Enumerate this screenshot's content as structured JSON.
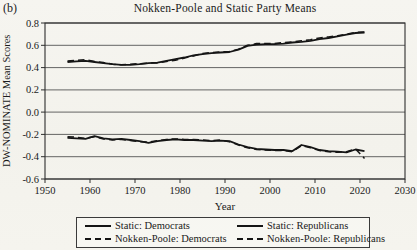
{
  "figure": {
    "panel_label": "(b)",
    "title": "Nokken-Poole and Static Party Means",
    "xlabel": "Year",
    "ylabel": "DW-NOMINATE Mean Scores"
  },
  "legend": {
    "items": [
      {
        "label": "Static: Democrats",
        "style": "solid"
      },
      {
        "label": "Static: Republicans",
        "style": "solid"
      },
      {
        "label": "Nokken-Poole: Democrats",
        "style": "dashed"
      },
      {
        "label": "Nokken-Poole: Republicans",
        "style": "dashed"
      }
    ]
  },
  "colors": {
    "ink": "#151515",
    "grid": "#555555",
    "paper": "#f5f4ef"
  },
  "chart_data": {
    "type": "line",
    "title": "Nokken-Poole and Static Party Means",
    "xlabel": "Year",
    "ylabel": "DW-NOMINATE Mean Scores",
    "xlim": [
      1950,
      2030
    ],
    "ylim": [
      -0.6,
      0.8
    ],
    "x_ticks": [
      1950,
      1960,
      1970,
      1980,
      1990,
      2000,
      2010,
      2020,
      2030
    ],
    "y_ticks": [
      0.8,
      0.6,
      0.4,
      0.2,
      0.0,
      -0.2,
      -0.4,
      -0.6
    ],
    "grid": "horizontal",
    "legend_position": "bottom",
    "x": [
      1955,
      1957,
      1959,
      1961,
      1963,
      1965,
      1967,
      1969,
      1971,
      1973,
      1975,
      1977,
      1979,
      1981,
      1983,
      1985,
      1987,
      1989,
      1991,
      1993,
      1995,
      1997,
      1999,
      2001,
      2003,
      2005,
      2007,
      2009,
      2011,
      2013,
      2015,
      2017,
      2019,
      2021
    ],
    "series": [
      {
        "name": "Static: Democrats",
        "style": "solid",
        "values": [
          -0.23,
          -0.235,
          -0.24,
          -0.215,
          -0.235,
          -0.245,
          -0.24,
          -0.25,
          -0.26,
          -0.275,
          -0.26,
          -0.25,
          -0.245,
          -0.25,
          -0.25,
          -0.255,
          -0.26,
          -0.255,
          -0.26,
          -0.29,
          -0.315,
          -0.33,
          -0.335,
          -0.34,
          -0.34,
          -0.35,
          -0.295,
          -0.315,
          -0.34,
          -0.35,
          -0.355,
          -0.36,
          -0.335,
          -0.35
        ]
      },
      {
        "name": "Static: Republicans",
        "style": "solid",
        "values": [
          0.45,
          0.455,
          0.46,
          0.45,
          0.44,
          0.43,
          0.425,
          0.425,
          0.43,
          0.44,
          0.445,
          0.46,
          0.475,
          0.49,
          0.51,
          0.52,
          0.53,
          0.535,
          0.54,
          0.56,
          0.595,
          0.605,
          0.61,
          0.61,
          0.615,
          0.625,
          0.63,
          0.64,
          0.655,
          0.665,
          0.68,
          0.695,
          0.71,
          0.715
        ]
      },
      {
        "name": "Nokken-Poole: Democrats",
        "style": "dashed",
        "values": [
          -0.22,
          -0.225,
          -0.235,
          -0.22,
          -0.24,
          -0.25,
          -0.245,
          -0.255,
          -0.265,
          -0.27,
          -0.255,
          -0.245,
          -0.24,
          -0.245,
          -0.245,
          -0.25,
          -0.255,
          -0.25,
          -0.265,
          -0.295,
          -0.32,
          -0.335,
          -0.34,
          -0.345,
          -0.345,
          -0.355,
          -0.3,
          -0.32,
          -0.345,
          -0.355,
          -0.36,
          -0.355,
          -0.33,
          -0.415
        ]
      },
      {
        "name": "Nokken-Poole: Republicans",
        "style": "dashed",
        "values": [
          0.46,
          0.465,
          0.47,
          0.455,
          0.445,
          0.43,
          0.425,
          0.43,
          0.435,
          0.44,
          0.44,
          0.455,
          0.465,
          0.485,
          0.505,
          0.525,
          0.535,
          0.54,
          0.545,
          0.565,
          0.6,
          0.615,
          0.615,
          0.615,
          0.625,
          0.63,
          0.64,
          0.65,
          0.665,
          0.675,
          0.685,
          0.7,
          0.715,
          0.72
        ]
      }
    ]
  }
}
